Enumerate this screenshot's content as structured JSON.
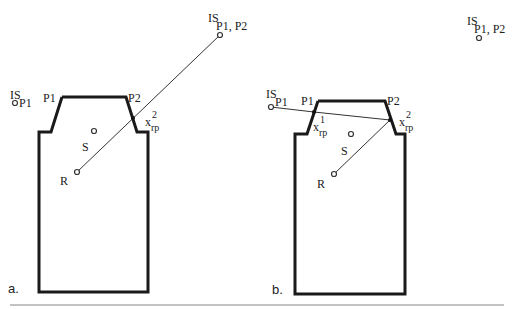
{
  "panels": [
    {
      "id": "a",
      "caption": "a.",
      "labels": {
        "p1": "P1",
        "p2": "P2",
        "s": "S",
        "r": "R",
        "is_p1_main": "IS",
        "is_p1_sub": "P1",
        "is_p1p2_main": "IS",
        "is_p1p2_sub": "P1, P2",
        "xrp2_main": "x",
        "xrp2_sub": "rp",
        "xrp2_sup": "2"
      }
    },
    {
      "id": "b",
      "caption": "b.",
      "labels": {
        "p1": "P1",
        "p2": "P2",
        "s": "S",
        "r": "R",
        "is_p1_main": "IS",
        "is_p1_sub": "P1",
        "is_p1p2_main": "IS",
        "is_p1p2_sub": "P1, P2",
        "xrp1_main": "x",
        "xrp1_sub": "rp",
        "xrp1_sup": "1",
        "xrp2_main": "x",
        "xrp2_sub": "rp",
        "xrp2_sup": "2"
      }
    }
  ],
  "colors": {
    "stroke": "#1a1a1a",
    "rule": "#888888"
  }
}
